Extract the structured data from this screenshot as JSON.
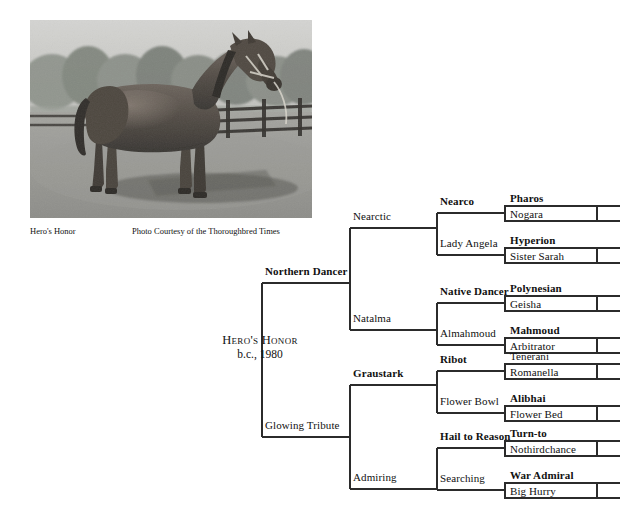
{
  "photo": {
    "alt_name": "horse-photograph-heros-honor",
    "caption_subject": "Hero's Honor",
    "caption_credit": "Photo Courtesy of the Thoroughbred Times"
  },
  "subject": {
    "name": "Hero's Honor",
    "description": "b.c., 1980"
  },
  "colors": {
    "line": "#2b2b2b",
    "text": "#111111",
    "background": "#ffffff"
  },
  "pedigree": {
    "generation2": [
      {
        "name": "Northern Dancer",
        "bold": true
      },
      {
        "name": "Glowing Tribute",
        "bold": false
      }
    ],
    "generation3": [
      {
        "name": "Nearctic",
        "bold": false
      },
      {
        "name": "Natalma",
        "bold": false
      },
      {
        "name": "Graustark",
        "bold": true
      },
      {
        "name": "Admiring",
        "bold": false
      }
    ],
    "generation4": [
      {
        "name": "Nearco",
        "bold": true
      },
      {
        "name": "Lady Angela",
        "bold": false
      },
      {
        "name": "Native Dancer",
        "bold": true
      },
      {
        "name": "Almahmoud",
        "bold": false
      },
      {
        "name": "Ribot",
        "bold": true
      },
      {
        "name": "Flower Bowl",
        "bold": false
      },
      {
        "name": "Hail to Reason",
        "bold": true
      },
      {
        "name": "Searching",
        "bold": false
      }
    ],
    "generation5": [
      {
        "sire": "Pharos",
        "sire_bold": true,
        "dam": "Nogara"
      },
      {
        "sire": "Hyperion",
        "sire_bold": true,
        "dam": "Sister Sarah"
      },
      {
        "sire": "Polynesian",
        "sire_bold": true,
        "dam": "Geisha"
      },
      {
        "sire": "Mahmoud",
        "sire_bold": true,
        "dam": "Arbitrator"
      },
      {
        "sire": "Tenerani",
        "sire_bold": false,
        "dam": "Romanella"
      },
      {
        "sire": "Alibhai",
        "sire_bold": true,
        "dam": "Flower Bed"
      },
      {
        "sire": "Turn-to",
        "sire_bold": true,
        "dam": "Nothirdchance"
      },
      {
        "sire": "War Admiral",
        "sire_bold": true,
        "dam": "Big Hurry"
      }
    ]
  }
}
